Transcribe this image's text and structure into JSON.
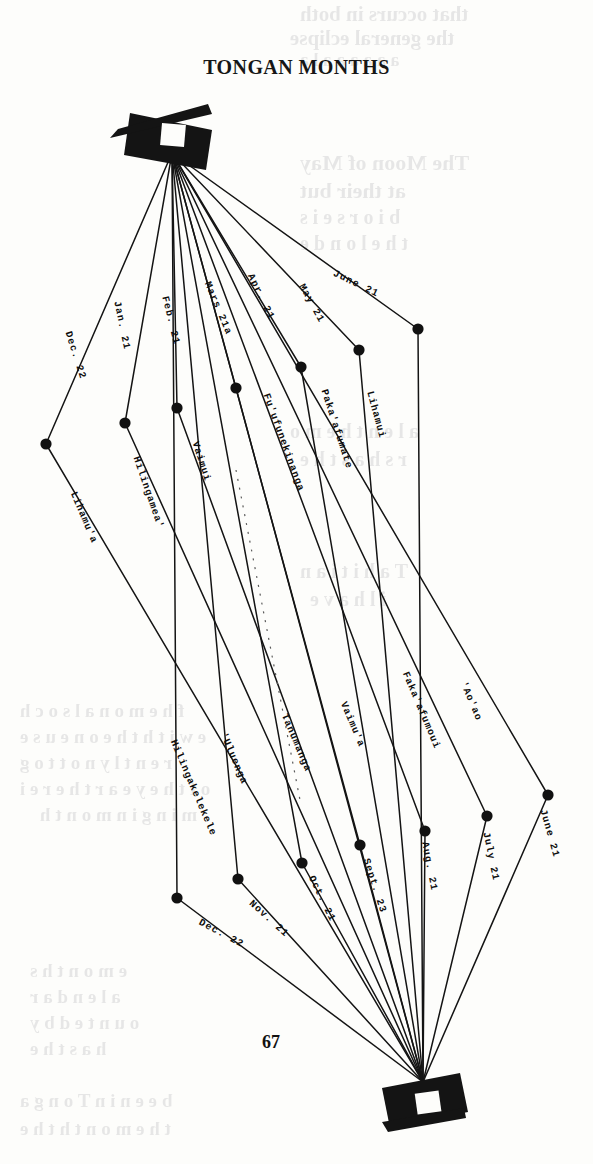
{
  "page": {
    "title": "TONGAN MONTHS",
    "page_number": "67"
  },
  "icons": {
    "top": "kite-flag-icon",
    "bottom": "kite-flag-icon"
  },
  "chart_data": {
    "type": "diagram",
    "title": "TONGAN MONTHS",
    "grid": false,
    "legend": false,
    "vertices": {
      "top": {
        "x": 172,
        "y": 153
      },
      "bottom": {
        "x": 423,
        "y": 1082
      }
    },
    "series": [
      {
        "name": "months",
        "entries": [
          {
            "index": 1,
            "month": "Lihamu'a",
            "date": "Dec. 22",
            "node": {
              "x": 46,
              "y": 444
            }
          },
          {
            "index": 2,
            "month": "Hilingamea'",
            "date": "Jan. 21",
            "node": {
              "x": 125,
              "y": 423
            }
          },
          {
            "index": 3,
            "month": "Vaimui",
            "date": "Feb. 21",
            "node": {
              "x": 177,
              "y": 408
            }
          },
          {
            "index": 4,
            "month": "Fu'ufunekinanga",
            "date": "Mars 21a",
            "node": {
              "x": 236,
              "y": 388
            }
          },
          {
            "index": 5,
            "month": "Paka'afumate",
            "date": "Apr. 21",
            "node": {
              "x": 301,
              "y": 367
            }
          },
          {
            "index": 6,
            "month": "Lihamui",
            "date": "May 21",
            "node": {
              "x": 359,
              "y": 350
            }
          },
          {
            "index": 7,
            "month": "'Ao'ao",
            "date": "June 21",
            "node": {
              "x": 418,
              "y": 329
            }
          },
          {
            "index": 8,
            "month": "Faka'afumoui",
            "date": "July 21",
            "node": {
              "x": 487,
              "y": 816
            }
          },
          {
            "index": 9,
            "month": "Vaimu'a",
            "date": "Aug. 21",
            "node": {
              "x": 425,
              "y": 831
            }
          },
          {
            "index": 10,
            "month": "Tanumanga",
            "date": "Sept. 23",
            "node": {
              "x": 360,
              "y": 845
            }
          },
          {
            "index": 11,
            "month": "'Uluenga",
            "date": "Oct. 21",
            "node": {
              "x": 302,
              "y": 863
            }
          },
          {
            "index": 12,
            "month": "Hilingakelekele",
            "date": "Nov. 21",
            "node": {
              "x": 238,
              "y": 879
            }
          },
          {
            "index": 13,
            "month": "",
            "date": "Dec. 22",
            "node": {
              "x": 177,
              "y": 898
            }
          },
          {
            "index": 14,
            "month": "",
            "date": "June 21",
            "node": {
              "x": 548,
              "y": 795
            }
          }
        ]
      }
    ]
  },
  "labels": {
    "dates": [
      {
        "id": "date-june-top",
        "text": "June 21",
        "x": 336,
        "y": 268,
        "rot": 26
      },
      {
        "id": "date-may",
        "text": "May 21",
        "x": 306,
        "y": 282,
        "rot": 61
      },
      {
        "id": "date-apr",
        "text": "Apr. 21",
        "x": 255,
        "y": 272,
        "rot": 64
      },
      {
        "id": "date-mars",
        "text": "Mars 21a",
        "x": 212,
        "y": 280,
        "rot": 67
      },
      {
        "id": "date-feb",
        "text": "Feb. 21",
        "x": 170,
        "y": 295,
        "rot": 76
      },
      {
        "id": "date-jan",
        "text": "Jan. 21",
        "x": 122,
        "y": 300,
        "rot": 78
      },
      {
        "id": "date-dec-top",
        "text": "Dec. 22",
        "x": 73,
        "y": 330,
        "rot": 72
      },
      {
        "id": "date-dec-bottom",
        "text": "Dec. 22",
        "x": 202,
        "y": 917,
        "rot": 28
      },
      {
        "id": "date-nov",
        "text": "Nov. 21",
        "x": 254,
        "y": 898,
        "rot": 42
      },
      {
        "id": "date-oct",
        "text": "Oct. 21",
        "x": 316,
        "y": 874,
        "rot": 64
      },
      {
        "id": "date-sept",
        "text": "Sept. 23",
        "x": 371,
        "y": 857,
        "rot": 72
      },
      {
        "id": "date-aug",
        "text": "Aug. 21",
        "x": 430,
        "y": 841,
        "rot": 79
      },
      {
        "id": "date-july",
        "text": "July 21",
        "x": 491,
        "y": 831,
        "rot": 78
      },
      {
        "id": "date-june-bot",
        "text": "June 21",
        "x": 548,
        "y": 808,
        "rot": 74
      }
    ],
    "months": [
      {
        "id": "month-lihamui",
        "text": "Lihamui",
        "x": 375,
        "y": 390,
        "rot": 75
      },
      {
        "id": "month-pakaafumate",
        "text": "Paka'afumate",
        "x": 329,
        "y": 388,
        "rot": 72
      },
      {
        "id": "month-fuufunekinanga",
        "text": "Fu'ufunekinanga",
        "x": 271,
        "y": 392,
        "rot": 70
      },
      {
        "id": "month-vaimui",
        "text": "Vaimui",
        "x": 200,
        "y": 440,
        "rot": 72
      },
      {
        "id": "month-hilingameaa",
        "text": "Hilingamea'",
        "x": 141,
        "y": 455,
        "rot": 71
      },
      {
        "id": "month-lihamua",
        "text": "Lihamu'a",
        "x": 78,
        "y": 490,
        "rot": 67
      },
      {
        "id": "month-aoao",
        "text": "'Ao'ao",
        "x": 468,
        "y": 680,
        "rot": 67
      },
      {
        "id": "month-fakaafumoui",
        "text": "Faka'afumoui",
        "x": 410,
        "y": 670,
        "rot": 67
      },
      {
        "id": "month-vaimua",
        "text": "Vaimu'a",
        "x": 348,
        "y": 700,
        "rot": 67
      },
      {
        "id": "month-tanumanga",
        "text": "Tanumanga",
        "x": 289,
        "y": 712,
        "rot": 67
      },
      {
        "id": "month-uluenga",
        "text": "'Uluenga",
        "x": 228,
        "y": 731,
        "rot": 67
      },
      {
        "id": "month-hilingakelekele",
        "text": "Hilingakelekele",
        "x": 178,
        "y": 738,
        "rot": 67
      }
    ]
  },
  "bleedthrough": [
    {
      "text": "that occurs in both",
      "x": 300,
      "y": 2,
      "size": 21
    },
    {
      "text": "the general eclipse",
      "x": 290,
      "y": 26,
      "size": 21
    },
    {
      "text": "a a a  a  a  a l a",
      "x": 300,
      "y": 50,
      "size": 18
    },
    {
      "text": "The Moon of May",
      "x": 300,
      "y": 150,
      "size": 22
    },
    {
      "text": "at their  but",
      "x": 300,
      "y": 178,
      "size": 22
    },
    {
      "text": "b i  o r s e  i  s",
      "x": 300,
      "y": 206,
      "size": 20
    },
    {
      "text": "t h e  l o  n  d e",
      "x": 300,
      "y": 232,
      "size": 20
    },
    {
      "text": "a l e n  t h e  m o",
      "x": 290,
      "y": 420,
      "size": 20
    },
    {
      "text": "r s  h a s  t h e",
      "x": 300,
      "y": 448,
      "size": 20
    },
    {
      "text": "T  a  h  i  t  i  a  n",
      "x": 300,
      "y": 560,
      "size": 20
    },
    {
      "text": "i l  h  a  v  e",
      "x": 310,
      "y": 588,
      "size": 20
    },
    {
      "text": "f h e  m  o  n  a l  s  o  c h",
      "x": 20,
      "y": 700,
      "size": 19
    },
    {
      "text": "e  w i t h  t h e  o n e  u  s e",
      "x": 20,
      "y": 726,
      "size": 19
    },
    {
      "text": "r e n t  l y  n o t  t  o  g",
      "x": 20,
      "y": 752,
      "size": 19
    },
    {
      "text": "o f  t h e  y e a r  t h e r e  i",
      "x": 20,
      "y": 778,
      "size": 19
    },
    {
      "text": "m i n g  i n  m o n t h",
      "x": 40,
      "y": 804,
      "size": 19
    },
    {
      "text": "e  m  o  n  t  h  s",
      "x": 30,
      "y": 960,
      "size": 19
    },
    {
      "text": "a  l  e  n  d  a  r",
      "x": 30,
      "y": 986,
      "size": 19
    },
    {
      "text": "o  u  n  t  e  d  b y",
      "x": 30,
      "y": 1012,
      "size": 19
    },
    {
      "text": "h  a  s  t  h  e",
      "x": 30,
      "y": 1038,
      "size": 19
    },
    {
      "text": "b e e n  i n  T o n g a",
      "x": 20,
      "y": 1090,
      "size": 19
    },
    {
      "text": "t  h  e  m o n  t  h  t  h  e",
      "x": 20,
      "y": 1118,
      "size": 19
    }
  ]
}
